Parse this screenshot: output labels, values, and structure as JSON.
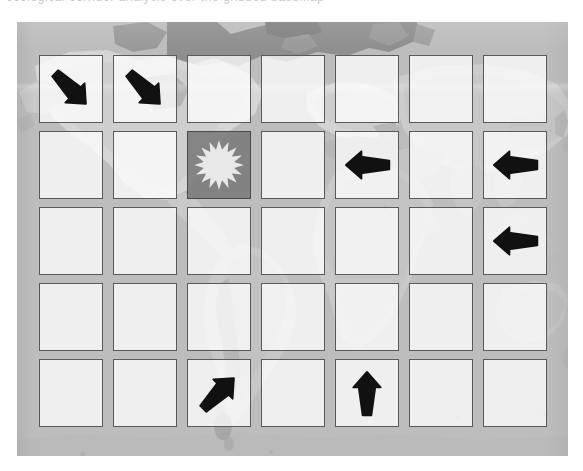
{
  "page": {
    "width": 583,
    "height": 471,
    "background_color": "#ffffff",
    "top_text_sliver": "ecological corridor analysis over the gridded basemap"
  },
  "colors": {
    "page_background": "#ffffff",
    "map_ocean": "#bdbdbd",
    "map_land": "#a3a3a3",
    "map_land_dark": "#8f8f8f",
    "map_land_light": "#d8d8d8",
    "cell_fill": "rgba(255,255,255,0.76)",
    "cell_border": "#5a5a5a",
    "highlight_cell_fill": "rgba(120,120,120,0.86)",
    "arrow_color": "#111111",
    "sunburst_color": "#e8e8e8"
  },
  "panel": {
    "name": "world-map-basemap",
    "x": 17,
    "y": 22,
    "width": 551,
    "height": 434
  },
  "grid": {
    "columns": 7,
    "rows": 5,
    "cell_width": 64,
    "cell_height": 68,
    "column_step": 74,
    "row_step": 76,
    "origin_x": 39,
    "origin_y": 55,
    "legend": {
      "arrow_down_right": "arrow-down-right",
      "arrow_left": "arrow-left",
      "arrow_up": "arrow-up",
      "arrow_up_right": "arrow-up-right",
      "sunburst": "sunburst-origin-marker",
      "empty": "empty"
    },
    "cells": [
      [
        {
          "row": 1,
          "col": 1,
          "glyph": "arrow-down-right",
          "label": "Arrow pointing down-right",
          "highlight": false
        },
        {
          "row": 1,
          "col": 2,
          "glyph": "arrow-down-right",
          "label": "Arrow pointing down-right",
          "highlight": false
        },
        {
          "row": 1,
          "col": 3,
          "glyph": "empty",
          "label": "Empty cell",
          "highlight": false
        },
        {
          "row": 1,
          "col": 4,
          "glyph": "empty",
          "label": "Empty cell",
          "highlight": false
        },
        {
          "row": 1,
          "col": 5,
          "glyph": "empty",
          "label": "Empty cell",
          "highlight": false
        },
        {
          "row": 1,
          "col": 6,
          "glyph": "empty",
          "label": "Empty cell",
          "highlight": false
        },
        {
          "row": 1,
          "col": 7,
          "glyph": "empty",
          "label": "Empty cell",
          "highlight": false
        }
      ],
      [
        {
          "row": 2,
          "col": 1,
          "glyph": "empty",
          "label": "Empty cell",
          "highlight": false
        },
        {
          "row": 2,
          "col": 2,
          "glyph": "empty",
          "label": "Empty cell",
          "highlight": false
        },
        {
          "row": 2,
          "col": 3,
          "glyph": "sunburst",
          "label": "Sunburst origin marker",
          "highlight": true
        },
        {
          "row": 2,
          "col": 4,
          "glyph": "empty",
          "label": "Empty cell",
          "highlight": false
        },
        {
          "row": 2,
          "col": 5,
          "glyph": "arrow-left",
          "label": "Arrow pointing left",
          "highlight": false
        },
        {
          "row": 2,
          "col": 6,
          "glyph": "empty",
          "label": "Empty cell",
          "highlight": false
        },
        {
          "row": 2,
          "col": 7,
          "glyph": "arrow-left",
          "label": "Arrow pointing left",
          "highlight": false
        }
      ],
      [
        {
          "row": 3,
          "col": 1,
          "glyph": "empty",
          "label": "Empty cell",
          "highlight": false
        },
        {
          "row": 3,
          "col": 2,
          "glyph": "empty",
          "label": "Empty cell",
          "highlight": false
        },
        {
          "row": 3,
          "col": 3,
          "glyph": "empty",
          "label": "Empty cell",
          "highlight": false
        },
        {
          "row": 3,
          "col": 4,
          "glyph": "empty",
          "label": "Empty cell",
          "highlight": false
        },
        {
          "row": 3,
          "col": 5,
          "glyph": "empty",
          "label": "Empty cell",
          "highlight": false
        },
        {
          "row": 3,
          "col": 6,
          "glyph": "empty",
          "label": "Empty cell",
          "highlight": false
        },
        {
          "row": 3,
          "col": 7,
          "glyph": "arrow-left",
          "label": "Arrow pointing left",
          "highlight": false
        }
      ],
      [
        {
          "row": 4,
          "col": 1,
          "glyph": "empty",
          "label": "Empty cell",
          "highlight": false
        },
        {
          "row": 4,
          "col": 2,
          "glyph": "empty",
          "label": "Empty cell",
          "highlight": false
        },
        {
          "row": 4,
          "col": 3,
          "glyph": "empty",
          "label": "Empty cell",
          "highlight": false
        },
        {
          "row": 4,
          "col": 4,
          "glyph": "empty",
          "label": "Empty cell",
          "highlight": false
        },
        {
          "row": 4,
          "col": 5,
          "glyph": "empty",
          "label": "Empty cell",
          "highlight": false
        },
        {
          "row": 4,
          "col": 6,
          "glyph": "empty",
          "label": "Empty cell",
          "highlight": false
        },
        {
          "row": 4,
          "col": 7,
          "glyph": "empty",
          "label": "Empty cell",
          "highlight": false
        }
      ],
      [
        {
          "row": 5,
          "col": 1,
          "glyph": "empty",
          "label": "Empty cell",
          "highlight": false
        },
        {
          "row": 5,
          "col": 2,
          "glyph": "empty",
          "label": "Empty cell",
          "highlight": false
        },
        {
          "row": 5,
          "col": 3,
          "glyph": "arrow-up-right",
          "label": "Arrow pointing up-right",
          "highlight": false
        },
        {
          "row": 5,
          "col": 4,
          "glyph": "empty",
          "label": "Empty cell",
          "highlight": false
        },
        {
          "row": 5,
          "col": 5,
          "glyph": "arrow-up",
          "label": "Arrow pointing up",
          "highlight": false
        },
        {
          "row": 5,
          "col": 6,
          "glyph": "empty",
          "label": "Empty cell",
          "highlight": false
        },
        {
          "row": 5,
          "col": 7,
          "glyph": "empty",
          "label": "Empty cell",
          "highlight": false
        }
      ]
    ]
  }
}
